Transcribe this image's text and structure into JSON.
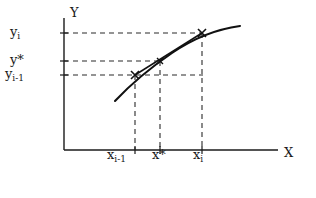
{
  "figure": {
    "axes": {
      "y_axis_label": "Y",
      "x_axis_label": "X",
      "y_axis_x_px": 64,
      "x_axis_y_px": 150,
      "x_axis_end_px": 278,
      "y_axis_top_px": 18
    },
    "y_ticks": [
      {
        "name": "y-i",
        "label_html": "y<sub>i</sub>",
        "y_px": 33
      },
      {
        "name": "y-star",
        "label_html": "y*",
        "y_px": 61
      },
      {
        "name": "y-i-minus-1",
        "label_html": "y<sub>i-1</sub>",
        "y_px": 75
      }
    ],
    "x_ticks": [
      {
        "name": "x-i-minus-1",
        "label_html": "x<sub>i-1</sub>",
        "x_px": 135
      },
      {
        "name": "x-star",
        "label_html": "x*",
        "x_px": 160
      },
      {
        "name": "x-i",
        "label_html": "x<sub>i</sub>",
        "x_px": 202
      }
    ],
    "points": [
      {
        "name": "point-lower",
        "x_px": 135,
        "y_px": 75,
        "x_label": "x_i-1",
        "y_label": "y_i-1"
      },
      {
        "name": "point-star",
        "x_px": 160,
        "y_px": 61,
        "x_label": "x*",
        "y_label": "y*"
      },
      {
        "name": "point-upper",
        "x_px": 202,
        "y_px": 33,
        "x_label": "x_i",
        "y_label": "y_i"
      }
    ],
    "curve": {
      "name": "function-curve",
      "path": "M 115 101 C 131 84 150 68 172 53 C 194 38 218 29 240 26",
      "description": "concave increasing curve"
    },
    "chord": {
      "name": "secant-chord",
      "x1_px": 135,
      "y1_px": 75,
      "x2_px": 202,
      "y2_px": 33
    },
    "colors": {
      "ink": "#1a1a1a",
      "dashed": "#2b2b2b",
      "background": "#ffffff"
    }
  },
  "labels": {
    "y_axis": "Y",
    "x_axis": "X",
    "y_i": "y",
    "y_i_sub": "i",
    "y_star": "y*",
    "y_im1": "y",
    "y_im1_sub": "i-1",
    "x_im1": "x",
    "x_im1_sub": "i-1",
    "x_star": "x*",
    "x_i": "x",
    "x_i_sub": "i"
  }
}
